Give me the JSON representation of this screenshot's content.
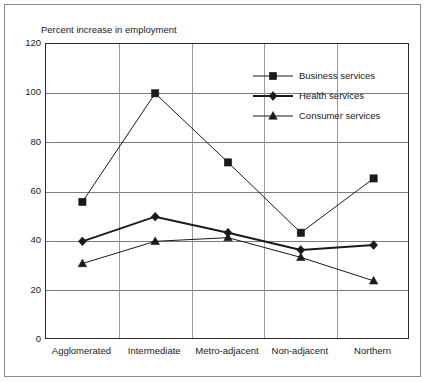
{
  "chart_data": {
    "type": "line",
    "title": "Percent increase in employment",
    "xlabel": "",
    "ylabel": "",
    "ylim": [
      0,
      120
    ],
    "yticks": [
      0,
      20,
      40,
      60,
      80,
      100,
      120
    ],
    "grid": true,
    "legend_position": "upper-right-inside",
    "categories": [
      "Agglomerated",
      "Intermediate",
      "Metro-adjacent",
      "Non-adjacent",
      "Northern"
    ],
    "series": [
      {
        "name": "Business services",
        "marker": "square",
        "line_width": 1,
        "color": "#1a1a1a",
        "values": [
          56,
          100,
          72,
          43.5,
          65.5
        ]
      },
      {
        "name": "Health services",
        "marker": "diamond",
        "line_width": 2,
        "color": "#1a1a1a",
        "values": [
          40,
          50,
          43.5,
          36.5,
          38.5
        ]
      },
      {
        "name": "Consumer services",
        "marker": "triangle",
        "line_width": 1,
        "color": "#1a1a1a",
        "values": [
          31,
          40,
          41.5,
          33.5,
          24
        ]
      }
    ]
  },
  "axis": {
    "ytick_labels": [
      "120",
      "100",
      "80",
      "60",
      "40",
      "20",
      "0"
    ]
  },
  "legend": {
    "items": [
      {
        "label": "Business services"
      },
      {
        "label": "Health services"
      },
      {
        "label": "Consumer services"
      }
    ]
  }
}
